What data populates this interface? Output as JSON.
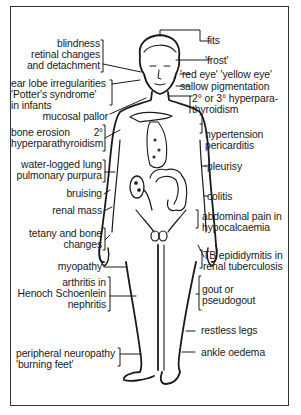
{
  "diagram": {
    "left_labels": [
      {
        "id": "blindness",
        "lines": [
          "blindness",
          "retinal changes",
          "and detachment"
        ]
      },
      {
        "id": "ear-lobe",
        "lines": [
          "ear lobe irregularities",
          "'Potter's syndrome'",
          "in infants"
        ]
      },
      {
        "id": "mucosal-pallor",
        "lines": [
          "mucosal pallor"
        ]
      },
      {
        "id": "bone-erosion",
        "lines": [
          "bone erosion",
          "hyperparathyroidism"
        ],
        "superscript": "2°"
      },
      {
        "id": "lung",
        "lines": [
          "water-logged lung",
          "pulmonary purpura"
        ]
      },
      {
        "id": "bruising",
        "lines": [
          "bruising"
        ]
      },
      {
        "id": "renal-mass",
        "lines": [
          "renal mass"
        ]
      },
      {
        "id": "tetany",
        "lines": [
          "tetany and bone",
          "changes"
        ]
      },
      {
        "id": "myopathy",
        "lines": [
          "myopathy"
        ]
      },
      {
        "id": "arthritis",
        "lines": [
          "arthritis in",
          "Henoch Schoenlein",
          "nephritis"
        ]
      },
      {
        "id": "neuropathy",
        "lines": [
          "peripheral neuropathy",
          "'burning feet'"
        ]
      }
    ],
    "right_labels": [
      {
        "id": "fits",
        "lines": [
          "fits"
        ]
      },
      {
        "id": "frost",
        "lines": [
          "'frost'"
        ]
      },
      {
        "id": "red-eye",
        "lines": [
          "'red eye' 'yellow eye'"
        ]
      },
      {
        "id": "sallow",
        "lines": [
          "sallow pigmentation"
        ]
      },
      {
        "id": "hyperpara",
        "lines": [
          "2° or 3° hyperpara-",
          "thyroidism"
        ]
      },
      {
        "id": "hypertension",
        "lines": [
          "hypertension",
          "pericarditis"
        ]
      },
      {
        "id": "pleurisy",
        "lines": [
          "pleurisy"
        ]
      },
      {
        "id": "colitis",
        "lines": [
          "colitis"
        ]
      },
      {
        "id": "abdominal-pain",
        "lines": [
          "abdominal pain in",
          "hypocalcaemia"
        ]
      },
      {
        "id": "tb",
        "lines": [
          "TB epididymitis in",
          "renal tuberculosis"
        ]
      },
      {
        "id": "gout",
        "lines": [
          "gout or",
          "pseudogout"
        ]
      },
      {
        "id": "restless",
        "lines": [
          "restless legs"
        ]
      },
      {
        "id": "ankle",
        "lines": [
          "ankle oedema"
        ]
      }
    ]
  }
}
